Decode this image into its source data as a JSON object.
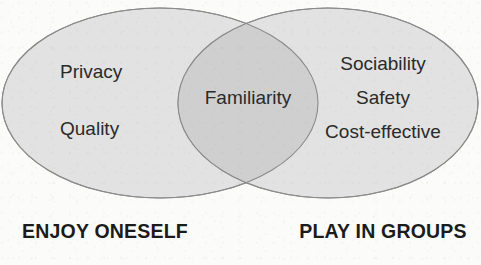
{
  "diagram": {
    "type": "venn",
    "title": "",
    "background_color": "#fbfbfa",
    "sets": [
      {
        "id": "left",
        "label": "ENJOY ONESELF",
        "fill_color": "#e2e2e2",
        "stroke_color": "#8b8b8b",
        "items": [
          "Privacy",
          "Quality"
        ]
      },
      {
        "id": "right",
        "label": "PLAY IN GROUPS",
        "fill_color": "#e2e2e2",
        "stroke_color": "#8b8b8b",
        "items": [
          "Sociability",
          "Safety",
          "Cost-effective"
        ]
      }
    ],
    "intersection": {
      "id": "overlap",
      "fill_color": "#cfcfcf",
      "stroke_color": "#8b8b8b",
      "items": [
        "Familiarity"
      ]
    },
    "text_color": "#2a2a2a",
    "label_color": "#1b1b1b"
  },
  "left_set": {
    "label": "ENJOY ONESELF",
    "item_1": "Privacy",
    "item_2": "Quality"
  },
  "right_set": {
    "label": "PLAY IN GROUPS",
    "item_1": "Sociability",
    "item_2": "Safety",
    "item_3": "Cost-effective"
  },
  "overlap": {
    "item_1": "Familiarity"
  }
}
